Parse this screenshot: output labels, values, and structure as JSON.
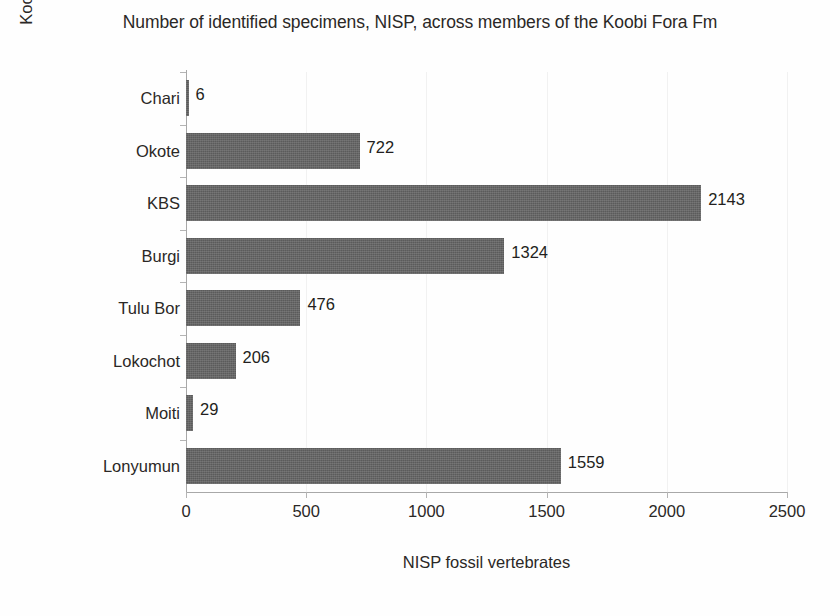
{
  "chart_data": {
    "type": "bar",
    "orientation": "horizontal",
    "title": "Number of identified specimens, NISP, across members of the Koobi Fora Fm",
    "xlabel": "NISP fossil vertebrates",
    "ylabel": "Koobi Fora Fm geological members",
    "categories": [
      "Chari",
      "Okote",
      "KBS",
      "Burgi",
      "Tulu Bor",
      "Lokochot",
      "Moiti",
      "Lonyumun"
    ],
    "values": [
      6,
      722,
      2143,
      1324,
      476,
      206,
      29,
      1559
    ],
    "data_labels": [
      "6",
      "722",
      "2143",
      "1324",
      "476",
      "206",
      "29",
      "1559"
    ],
    "xlim": [
      0,
      2500
    ],
    "xticks": [
      0,
      500,
      1000,
      1500,
      2000,
      2500
    ],
    "xtick_labels": [
      "0",
      "500",
      "1000",
      "1500",
      "2000",
      "2500"
    ],
    "grid": "vertical-light",
    "legend": "none",
    "bar_color": "#5b5b5b",
    "gridline_color": "#f1f1f1",
    "axis_color": "#a8a8a8",
    "text_color": "#231f20",
    "background_color": "#fefefe"
  }
}
